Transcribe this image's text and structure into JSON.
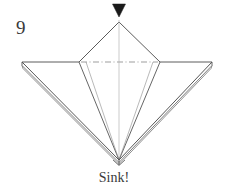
{
  "figure": {
    "step_number": "9",
    "caption": "Sink!",
    "background_color": "#ffffff",
    "line_color": "#4a4a4a",
    "layer_line_color": "#6e6e6e",
    "centerline_color": "#8d8d8d",
    "text_color": "#3a3a3a",
    "arrow_color": "#1a1a1a",
    "width": 228,
    "height": 194
  },
  "diagram": {
    "type": "origami-step",
    "instruction": "Sink!",
    "arrow": {
      "name": "sink-arrow",
      "direction": "down",
      "style": "solid-filled-triangle",
      "x": 119,
      "y_top": 4,
      "y_tip": 16
    },
    "vertices": {
      "apex": [
        119,
        22
      ],
      "left_corner": [
        79,
        62
      ],
      "right_corner": [
        160,
        62
      ],
      "bottom_point": [
        119,
        160
      ],
      "left_wing_tip": [
        22,
        62
      ],
      "right_wing_tip": [
        212,
        62
      ]
    },
    "centerline": {
      "name": "horizontal-axis-dash-dot",
      "from": [
        82,
        62
      ],
      "to": [
        157,
        62
      ],
      "pattern": "dash-dot"
    },
    "vertical_centerline": {
      "name": "vertical-axis-line",
      "from": [
        119,
        22
      ],
      "to": [
        119,
        160
      ]
    },
    "layer_counts": {
      "left_wing": 3,
      "right_wing": 3
    }
  }
}
